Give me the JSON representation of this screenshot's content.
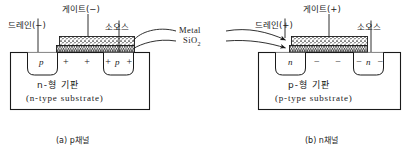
{
  "figure": {
    "materials": {
      "metal_label": "Metal",
      "oxide_label": "SiO",
      "oxide_sub": "2"
    }
  },
  "panel_a": {
    "caption": "(a) p채널",
    "caption_index": "(a)",
    "caption_text": "p채널",
    "terminals": {
      "drain": "드레인(−)",
      "gate": "게이트(−)",
      "source": "소오스"
    },
    "wells": {
      "left": "p",
      "right": "p"
    },
    "channel_symbols": "+ + + +",
    "channel_carrier": "+",
    "channel_count": 4,
    "substrate_ko": "n-형 기판",
    "substrate_en": "(n-type substrate)"
  },
  "panel_b": {
    "caption": "(b) n채널",
    "caption_index": "(b)",
    "caption_text": "n채널",
    "terminals": {
      "drain": "드레인(+)",
      "gate": "게이트(+)",
      "source": "소오스"
    },
    "wells": {
      "left": "n",
      "right": "n"
    },
    "channel_symbols": "− − − −",
    "channel_carrier": "−",
    "channel_count": 4,
    "substrate_ko": "p-형 기판",
    "substrate_en": "(p-type substrate)"
  },
  "colors": {
    "ink": "#1a1a1a",
    "paper": "#ffffff",
    "metal_fill": "#f0f0f0",
    "oxide_fill": "#dadada"
  }
}
